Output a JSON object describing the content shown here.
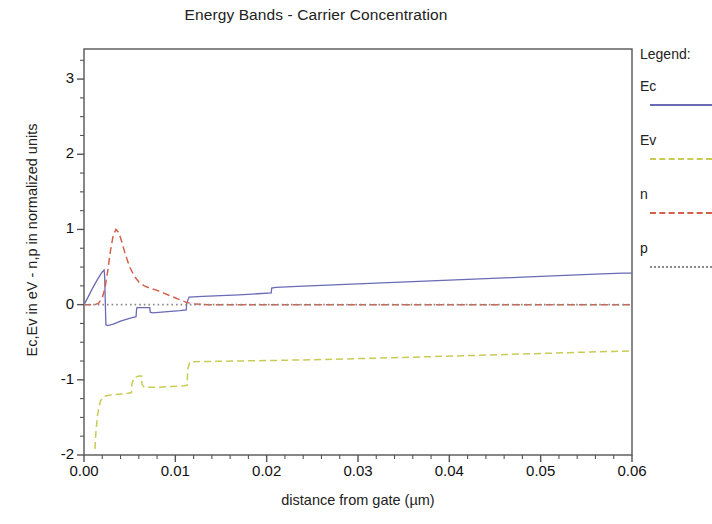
{
  "chart_data": {
    "type": "line",
    "title": "Energy Bands - Carrier Concentration",
    "xlabel": "distance from gate (µm)",
    "ylabel": "Ec,Ev in eV - n,p in normalized units",
    "xlim": [
      0.0,
      0.06
    ],
    "ylim": [
      -2.0,
      3.4
    ],
    "xticks": [
      0.0,
      0.01,
      0.02,
      0.03,
      0.04,
      0.05,
      0.06
    ],
    "xtick_labels": [
      "0.00",
      "0.01",
      "0.02",
      "0.03",
      "0.04",
      "0.05",
      "0.06"
    ],
    "yticks": [
      -2,
      -1,
      0,
      1,
      2,
      3
    ],
    "ytick_labels": [
      "-2",
      "-1",
      "0",
      "1",
      "2",
      "3"
    ],
    "x_minor_step": 0.002,
    "y_minor_step": 0.25,
    "grid": false,
    "legend_position": "right-outside",
    "legend_title": "Legend:",
    "series": [
      {
        "name": "Ec",
        "label": "Ec",
        "color": "#6a6ab5",
        "style": "solid",
        "points": [
          [
            0.0,
            0.0
          ],
          [
            0.0004,
            0.09
          ],
          [
            0.0009,
            0.21
          ],
          [
            0.0014,
            0.32
          ],
          [
            0.0019,
            0.42
          ],
          [
            0.0022,
            0.46
          ],
          [
            0.00225,
            0.4
          ],
          [
            0.0023,
            0.2
          ],
          [
            0.00235,
            -0.05
          ],
          [
            0.0024,
            -0.27
          ],
          [
            0.0026,
            -0.28
          ],
          [
            0.0032,
            -0.26
          ],
          [
            0.004,
            -0.22
          ],
          [
            0.0048,
            -0.19
          ],
          [
            0.0054,
            -0.17
          ],
          [
            0.0057,
            -0.16
          ],
          [
            0.00575,
            -0.07
          ],
          [
            0.0058,
            -0.04
          ],
          [
            0.0065,
            -0.04
          ],
          [
            0.0072,
            -0.04
          ],
          [
            0.00725,
            -0.1
          ],
          [
            0.0075,
            -0.11
          ],
          [
            0.0085,
            -0.1
          ],
          [
            0.0095,
            -0.09
          ],
          [
            0.0105,
            -0.08
          ],
          [
            0.0112,
            -0.07
          ],
          [
            0.01125,
            0.02
          ],
          [
            0.0115,
            0.1
          ],
          [
            0.013,
            0.11
          ],
          [
            0.015,
            0.12
          ],
          [
            0.017,
            0.13
          ],
          [
            0.019,
            0.145
          ],
          [
            0.0205,
            0.155
          ],
          [
            0.02055,
            0.22
          ],
          [
            0.021,
            0.23
          ],
          [
            0.024,
            0.245
          ],
          [
            0.028,
            0.265
          ],
          [
            0.032,
            0.285
          ],
          [
            0.036,
            0.305
          ],
          [
            0.04,
            0.325
          ],
          [
            0.044,
            0.345
          ],
          [
            0.048,
            0.365
          ],
          [
            0.052,
            0.385
          ],
          [
            0.056,
            0.405
          ],
          [
            0.059,
            0.418
          ],
          [
            0.06,
            0.42
          ]
        ]
      },
      {
        "name": "Ev",
        "label": "Ev",
        "color": "#c8cc55",
        "style": "dashed",
        "points": [
          [
            0.0012,
            -1.92
          ],
          [
            0.0013,
            -1.7
          ],
          [
            0.0015,
            -1.45
          ],
          [
            0.0018,
            -1.28
          ],
          [
            0.0022,
            -1.22
          ],
          [
            0.003,
            -1.2
          ],
          [
            0.004,
            -1.19
          ],
          [
            0.0048,
            -1.18
          ],
          [
            0.0052,
            -1.17
          ],
          [
            0.00525,
            -1.05
          ],
          [
            0.0055,
            -0.97
          ],
          [
            0.006,
            -0.95
          ],
          [
            0.0063,
            -0.95
          ],
          [
            0.00635,
            -1.06
          ],
          [
            0.0066,
            -1.1
          ],
          [
            0.008,
            -1.1
          ],
          [
            0.0095,
            -1.09
          ],
          [
            0.011,
            -1.08
          ],
          [
            0.0113,
            -1.07
          ],
          [
            0.01135,
            -0.86
          ],
          [
            0.0116,
            -0.76
          ],
          [
            0.014,
            -0.755
          ],
          [
            0.018,
            -0.748
          ],
          [
            0.022,
            -0.74
          ],
          [
            0.026,
            -0.73
          ],
          [
            0.03,
            -0.718
          ],
          [
            0.034,
            -0.705
          ],
          [
            0.038,
            -0.692
          ],
          [
            0.042,
            -0.678
          ],
          [
            0.046,
            -0.664
          ],
          [
            0.05,
            -0.65
          ],
          [
            0.054,
            -0.635
          ],
          [
            0.058,
            -0.622
          ],
          [
            0.06,
            -0.615
          ]
        ]
      },
      {
        "name": "n",
        "label": "n",
        "color": "#d4604a",
        "style": "dashed",
        "points": [
          [
            0.0,
            0.0
          ],
          [
            0.0012,
            0.0
          ],
          [
            0.0016,
            0.02
          ],
          [
            0.002,
            0.09
          ],
          [
            0.0023,
            0.22
          ],
          [
            0.0026,
            0.45
          ],
          [
            0.0029,
            0.72
          ],
          [
            0.0032,
            0.92
          ],
          [
            0.0035,
            1.0
          ],
          [
            0.0038,
            0.96
          ],
          [
            0.0041,
            0.85
          ],
          [
            0.0045,
            0.68
          ],
          [
            0.005,
            0.5
          ],
          [
            0.0055,
            0.38
          ],
          [
            0.006,
            0.3
          ],
          [
            0.0066,
            0.25
          ],
          [
            0.0072,
            0.22
          ],
          [
            0.008,
            0.19
          ],
          [
            0.0088,
            0.15
          ],
          [
            0.0096,
            0.11
          ],
          [
            0.0104,
            0.07
          ],
          [
            0.0112,
            0.03
          ],
          [
            0.012,
            0.01
          ],
          [
            0.0135,
            0.0
          ],
          [
            0.02,
            0.0
          ],
          [
            0.03,
            0.0
          ],
          [
            0.04,
            0.0
          ],
          [
            0.05,
            0.0
          ],
          [
            0.06,
            0.0
          ]
        ]
      },
      {
        "name": "p",
        "label": "p",
        "color": "#8a8a8a",
        "style": "dotted",
        "points": [
          [
            0.0,
            0.0
          ],
          [
            0.01,
            0.0
          ],
          [
            0.02,
            0.0
          ],
          [
            0.03,
            0.0
          ],
          [
            0.04,
            0.0
          ],
          [
            0.05,
            0.0
          ],
          [
            0.06,
            0.0
          ]
        ]
      }
    ]
  },
  "axis_color": "#555555",
  "plot_bg": "#ffffff"
}
